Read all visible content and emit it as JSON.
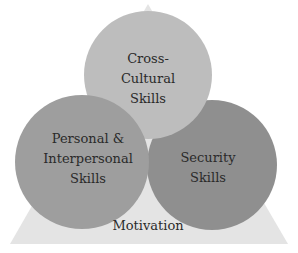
{
  "diagram": {
    "type": "venn-on-triangle",
    "base": {
      "label": "Motivation",
      "color": "#e4e4e4"
    },
    "circles": [
      {
        "id": "cross-cultural",
        "lines": [
          "Cross-",
          "Cultural",
          "Skills"
        ],
        "color": "#bdbdbd"
      },
      {
        "id": "personal-interpersonal",
        "lines": [
          "Personal &",
          "Interpersonal",
          "Skills"
        ],
        "color": "#9e9e9e"
      },
      {
        "id": "security",
        "lines": [
          "Security",
          "Skills"
        ],
        "color": "#8f8f8f"
      }
    ]
  }
}
